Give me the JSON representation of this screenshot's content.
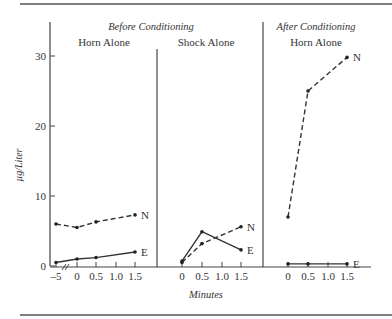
{
  "chart_data": {
    "type": "line",
    "ylabel": "µg/Liter",
    "xlabel": "Minutes",
    "ylim": [
      0,
      33
    ],
    "yticks": [
      0,
      10,
      20,
      30
    ],
    "grid": false,
    "group_labels": [
      "Before Conditioning",
      "After Conditioning"
    ],
    "panels": [
      {
        "group": "Before Conditioning",
        "title": "Horn Alone",
        "x": [
          -5,
          0,
          0.5,
          1.5
        ],
        "xtick_labels": [
          "-5",
          "0",
          "0.5",
          "1.0",
          "1.5"
        ],
        "axis_break_between": [
          -5,
          0
        ],
        "series": [
          {
            "name": "N",
            "style": "dashed",
            "values": [
              6.0,
              5.5,
              6.3,
              7.3
            ]
          },
          {
            "name": "E",
            "style": "solid",
            "values": [
              0.5,
              1.0,
              1.2,
              2.0
            ]
          }
        ]
      },
      {
        "group": "Before Conditioning",
        "title": "Shock Alone",
        "x": [
          0,
          0.5,
          1.5
        ],
        "xtick_labels": [
          "0",
          "0.5",
          "1.0",
          "1.5"
        ],
        "series": [
          {
            "name": "N",
            "style": "dashed",
            "values": [
              0.5,
              3.2,
              5.6
            ]
          },
          {
            "name": "E",
            "style": "solid",
            "values": [
              0.7,
              4.9,
              2.3
            ]
          }
        ]
      },
      {
        "group": "After Conditioning",
        "title": "Horn Alone",
        "x": [
          0,
          0.5,
          1.5
        ],
        "xtick_labels": [
          "0",
          "0.5",
          "1.0",
          "1.5"
        ],
        "series": [
          {
            "name": "N",
            "style": "dashed",
            "values": [
              7.0,
              25.0,
              29.8
            ]
          },
          {
            "name": "E",
            "style": "solid",
            "values": [
              0.3,
              0.3,
              0.3
            ]
          }
        ]
      }
    ]
  }
}
